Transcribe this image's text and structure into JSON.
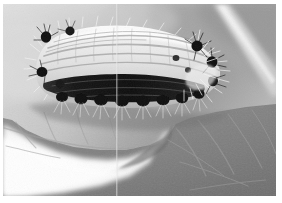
{
  "image": {
    "kind": "natural-photograph",
    "subject": "hairy caterpillar feeding on leaf edge",
    "color_mode": "grayscale",
    "width": 282,
    "height": 203,
    "orientation": "landscape",
    "alt_text": "Black and white macro photograph of a pale, hairy caterpillar resting along the chewed edge of a leaf"
  },
  "border": {
    "present": true,
    "color": "#ffffff",
    "top_px": 4,
    "left_px": 3,
    "right_px": 6,
    "bottom_px": 7
  },
  "palette": {
    "background_light": "#d9d9d9",
    "background_mid": "#bdbdbd",
    "background_dark": "#a2a2a2",
    "twig_highlight": "#e8e8e8",
    "leaf_upper": "#8e8e8e",
    "leaf_mid": "#7d7d7d",
    "leaf_shadow": "#6a6a6a",
    "leaf_vein": "#9c9c9c",
    "bright_gap": "#fbfbfb",
    "bright_gap_soft": "#ededed",
    "caterpillar_body": "#e6e6e6",
    "caterpillar_highlight": "#f6f6f6",
    "caterpillar_stripe": "#9a9a9a",
    "caterpillar_dark_band": "#1d1d1d",
    "tuft_black": "#0e0e0e",
    "hair_white": "#f2f2f2",
    "seam_line": "#e2e2e2"
  },
  "scene": {
    "regions": [
      {
        "name": "background-blur-upper-left",
        "description": "Out-of-focus pale gray foliage backdrop in the upper left",
        "tone": "#d9d9d9"
      },
      {
        "name": "background-blur-upper-right",
        "description": "Darker gray out-of-focus leaf mass in the upper right",
        "tone": "#a6a6a6"
      },
      {
        "name": "diagonal-twig",
        "description": "Pale diagonal stem crossing the upper right corner toward lower right",
        "tone": "#e8e8e8"
      },
      {
        "name": "host-leaf",
        "description": "Large gray leaf occupying the lower two thirds, its upper margin chewed away",
        "tone": "#828282"
      },
      {
        "name": "leaf-veins",
        "description": "Lighter branching veins radiating across the leaf surface",
        "tone": "#9c9c9c"
      },
      {
        "name": "bright-gap",
        "description": "Blown-out white area below the leaf margin in the lower left",
        "tone": "#fbfbfb"
      },
      {
        "name": "seam-line",
        "description": "Faint vertical scanning seam near the horizontal center of the frame",
        "tone": "#e2e2e2"
      }
    ],
    "subject": {
      "name": "caterpillar",
      "pose": "lying horizontally along the leaf edge, head to the right, tail to the left",
      "body_tone": "#e6e6e6",
      "features": [
        {
          "name": "dorsal-stripes",
          "description": "Series of fine gray longitudinal stripes running the length of the pale back"
        },
        {
          "name": "lateral-dark-band",
          "description": "Thick near-black band running horizontally along the lower flank"
        },
        {
          "name": "spiracle-spots",
          "description": "Row of round black spots spaced beneath the dark band"
        },
        {
          "name": "hair-tufts",
          "description": "Dense black tufts with radiating white setae at the tail, shoulders and head"
        },
        {
          "name": "white-setae",
          "description": "Fine pale hairs fringing the whole body silhouette"
        }
      ],
      "segments": 9,
      "tuft_count": 8
    }
  }
}
